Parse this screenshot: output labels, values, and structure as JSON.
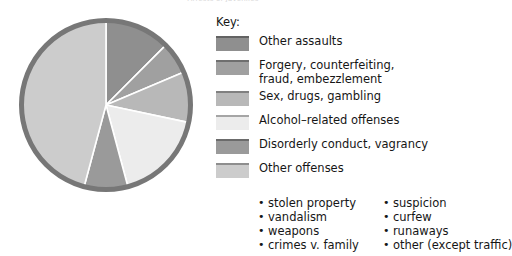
{
  "chart_data": {
    "type": "pie",
    "title": "Arrests of Juveniles",
    "legend_position": "right",
    "categories": [
      "Other assaults",
      "Forgery, counterfeiting, fraud, embezzlement",
      "Sex, drugs, gambling",
      "Alcohol–related offenses",
      "Disorderly conduct, vagrancy",
      "Other offenses"
    ],
    "values": [
      12.5,
      6.1,
      9.7,
      17.5,
      8.3,
      45.9
    ],
    "angles_deg": [
      45,
      22,
      35,
      63,
      30,
      165
    ],
    "colors": [
      "#8f8f8f",
      "#a0a0a0",
      "#b8b8b8",
      "#ececec",
      "#9a9a9a",
      "#cccccc"
    ],
    "rim_color": "#777777",
    "separator_color": "#ffffff",
    "start_angle_deg": 0,
    "direction": "clockwise"
  },
  "key": {
    "title": "Key:",
    "items": [
      {
        "label": "Other assaults",
        "color": "#8f8f8f"
      },
      {
        "label": "Forgery, counterfeiting,\nfraud, embezzlement",
        "color": "#a0a0a0"
      },
      {
        "label": "Sex, drugs, gambling",
        "color": "#b8b8b8"
      },
      {
        "label": "Alcohol–related offenses",
        "color": "#ececec"
      },
      {
        "label": "Disorderly conduct, vagrancy",
        "color": "#9a9a9a"
      },
      {
        "label": "Other offenses",
        "color": "#cccccc"
      }
    ]
  },
  "other_offenses_detail": {
    "column_left": [
      "stolen property",
      "vandalism",
      "weapons",
      "crimes v. family"
    ],
    "column_right": [
      "suspicion",
      "curfew",
      "runaways",
      "other (except traffic)"
    ]
  }
}
